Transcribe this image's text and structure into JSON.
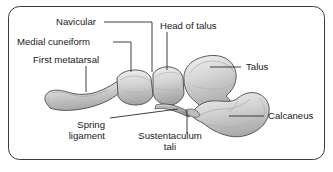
{
  "figure": {
    "border_color": "#3a3a3a",
    "background_color": "#ffffff",
    "bone_fill_light": "#e2e2e2",
    "bone_fill_mid": "#c9c9c9",
    "bone_fill_dark": "#ababab",
    "bone_outline": "#4a4a4a",
    "leader_color": "#2b2b2b",
    "text_color": "#1a1a1a"
  },
  "labels": {
    "navicular": "Navicular",
    "medial_cuneiform": "Medial cuneiform",
    "first_metatarsal": "First metatarsal",
    "head_of_talus": "Head of talus",
    "talus": "Talus",
    "calcaneus": "Calcaneus",
    "spring_ligament_line1": "Spring",
    "spring_ligament_line2": "ligament",
    "sustentaculum_line1": "Sustentaculum",
    "sustentaculum_line2": "tali"
  }
}
